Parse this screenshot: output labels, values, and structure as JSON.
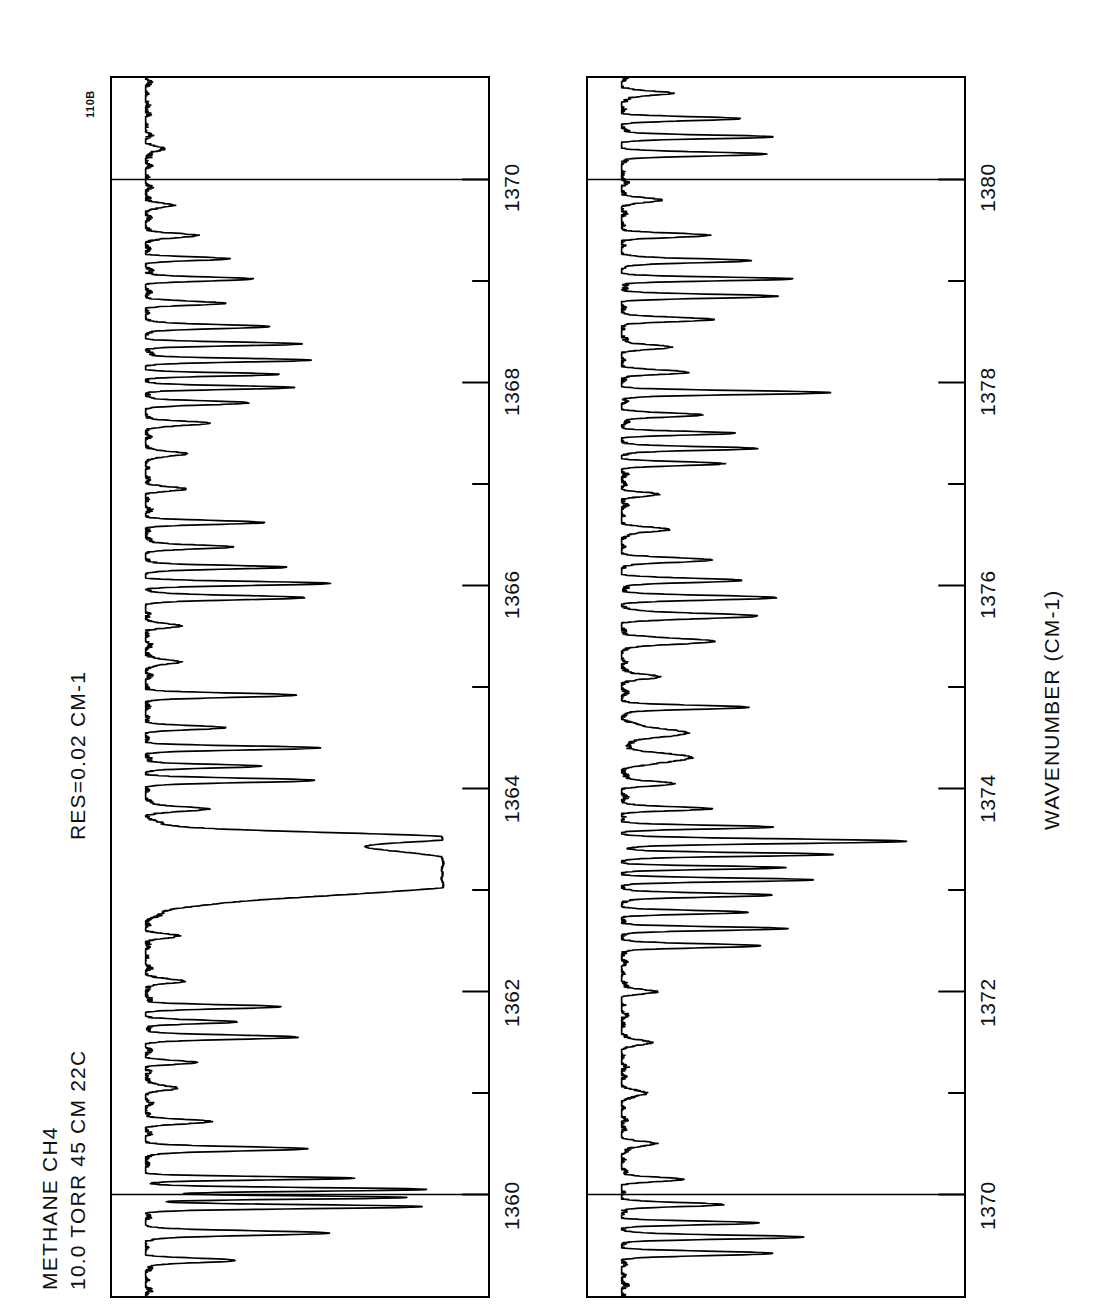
{
  "figure": {
    "corner_tag": "110B",
    "header_lines": [
      "METHANE   CH4",
      "10.0 TORR  45 CM 22C"
    ],
    "resolution_label": "RES=0.02  CM-1",
    "axis_title": "WAVENUMBER (CM-1)",
    "orientation": "rotated-90",
    "line_color": "#000000",
    "background_color": "#ffffff"
  },
  "chart_data": [
    {
      "type": "line",
      "id": "panel-upper",
      "title": "METHANE CH4 absorption spectrum 1359-1371 cm-1",
      "xlabel": "WAVENUMBER (CM-1)",
      "ylabel": "TRANSMITTANCE",
      "xlim": [
        1359.0,
        1371.0
      ],
      "ylim": [
        0.0,
        1.0
      ],
      "grid": false,
      "major_ticks": [
        1360,
        1362,
        1364,
        1366,
        1368,
        1370
      ],
      "minor_ticks": [
        1359,
        1361,
        1363,
        1365,
        1367,
        1369,
        1371
      ],
      "tick_labels": [
        "1360",
        "1362",
        "1364",
        "1366",
        "1368",
        "1370"
      ],
      "full_width_gridlines": [
        1360,
        1370
      ],
      "baseline": 0.97,
      "peaks": [
        {
          "x": 1359.35,
          "depth": 0.3,
          "width": 0.028
        },
        {
          "x": 1359.62,
          "depth": 0.62,
          "width": 0.03
        },
        {
          "x": 1359.88,
          "depth": 0.93,
          "width": 0.026
        },
        {
          "x": 1359.97,
          "depth": 0.88,
          "width": 0.022
        },
        {
          "x": 1360.05,
          "depth": 0.95,
          "width": 0.024
        },
        {
          "x": 1360.16,
          "depth": 0.7,
          "width": 0.022
        },
        {
          "x": 1360.45,
          "depth": 0.55,
          "width": 0.028
        },
        {
          "x": 1360.72,
          "depth": 0.22,
          "width": 0.03
        },
        {
          "x": 1361.05,
          "depth": 0.12,
          "width": 0.03
        },
        {
          "x": 1361.3,
          "depth": 0.17,
          "width": 0.026
        },
        {
          "x": 1361.55,
          "depth": 0.52,
          "width": 0.028
        },
        {
          "x": 1361.7,
          "depth": 0.3,
          "width": 0.024
        },
        {
          "x": 1361.85,
          "depth": 0.46,
          "width": 0.026
        },
        {
          "x": 1362.1,
          "depth": 0.14,
          "width": 0.03
        },
        {
          "x": 1362.55,
          "depth": 0.1,
          "width": 0.034
        },
        {
          "x": 1363.05,
          "depth": 0.88,
          "width": 0.15
        },
        {
          "x": 1363.3,
          "depth": 0.97,
          "width": 0.19
        },
        {
          "x": 1363.52,
          "depth": 0.74,
          "width": 0.06
        },
        {
          "x": 1363.8,
          "depth": 0.2,
          "width": 0.03
        },
        {
          "x": 1364.08,
          "depth": 0.56,
          "width": 0.028
        },
        {
          "x": 1364.22,
          "depth": 0.4,
          "width": 0.024
        },
        {
          "x": 1364.4,
          "depth": 0.58,
          "width": 0.026
        },
        {
          "x": 1364.6,
          "depth": 0.26,
          "width": 0.026
        },
        {
          "x": 1364.92,
          "depth": 0.5,
          "width": 0.028
        },
        {
          "x": 1365.25,
          "depth": 0.13,
          "width": 0.03
        },
        {
          "x": 1365.6,
          "depth": 0.11,
          "width": 0.03
        },
        {
          "x": 1365.88,
          "depth": 0.54,
          "width": 0.028
        },
        {
          "x": 1366.02,
          "depth": 0.62,
          "width": 0.026
        },
        {
          "x": 1366.18,
          "depth": 0.48,
          "width": 0.024
        },
        {
          "x": 1366.38,
          "depth": 0.3,
          "width": 0.026
        },
        {
          "x": 1366.62,
          "depth": 0.4,
          "width": 0.026
        },
        {
          "x": 1366.95,
          "depth": 0.12,
          "width": 0.03
        },
        {
          "x": 1367.3,
          "depth": 0.14,
          "width": 0.03
        },
        {
          "x": 1367.6,
          "depth": 0.22,
          "width": 0.028
        },
        {
          "x": 1367.8,
          "depth": 0.34,
          "width": 0.026
        },
        {
          "x": 1367.95,
          "depth": 0.5,
          "width": 0.024
        },
        {
          "x": 1368.08,
          "depth": 0.44,
          "width": 0.022
        },
        {
          "x": 1368.22,
          "depth": 0.56,
          "width": 0.024
        },
        {
          "x": 1368.38,
          "depth": 0.52,
          "width": 0.024
        },
        {
          "x": 1368.55,
          "depth": 0.42,
          "width": 0.026
        },
        {
          "x": 1368.78,
          "depth": 0.26,
          "width": 0.026
        },
        {
          "x": 1369.02,
          "depth": 0.36,
          "width": 0.026
        },
        {
          "x": 1369.22,
          "depth": 0.28,
          "width": 0.024
        },
        {
          "x": 1369.45,
          "depth": 0.18,
          "width": 0.028
        },
        {
          "x": 1369.75,
          "depth": 0.1,
          "width": 0.03
        },
        {
          "x": 1370.3,
          "depth": 0.07,
          "width": 0.034
        }
      ]
    },
    {
      "type": "line",
      "id": "panel-lower",
      "title": "METHANE CH4 absorption spectrum 1369-1381 cm-1",
      "xlabel": "WAVENUMBER (CM-1)",
      "ylabel": "TRANSMITTANCE",
      "xlim": [
        1369.0,
        1381.0
      ],
      "ylim": [
        0.0,
        1.0
      ],
      "grid": false,
      "major_ticks": [
        1370,
        1372,
        1374,
        1376,
        1378,
        1380
      ],
      "minor_ticks": [
        1369,
        1371,
        1373,
        1375,
        1377,
        1379,
        1381
      ],
      "tick_labels": [
        "1370",
        "1372",
        "1374",
        "1376",
        "1378",
        "1380"
      ],
      "full_width_gridlines": [
        1370,
        1380
      ],
      "baseline": 0.97,
      "peaks": [
        {
          "x": 1369.42,
          "depth": 0.5,
          "width": 0.028
        },
        {
          "x": 1369.58,
          "depth": 0.62,
          "width": 0.026
        },
        {
          "x": 1369.72,
          "depth": 0.46,
          "width": 0.024
        },
        {
          "x": 1369.9,
          "depth": 0.34,
          "width": 0.026
        },
        {
          "x": 1370.15,
          "depth": 0.2,
          "width": 0.028
        },
        {
          "x": 1370.5,
          "depth": 0.12,
          "width": 0.03
        },
        {
          "x": 1371.0,
          "depth": 0.09,
          "width": 0.032
        },
        {
          "x": 1371.5,
          "depth": 0.1,
          "width": 0.032
        },
        {
          "x": 1372.0,
          "depth": 0.11,
          "width": 0.03
        },
        {
          "x": 1372.45,
          "depth": 0.48,
          "width": 0.026
        },
        {
          "x": 1372.62,
          "depth": 0.56,
          "width": 0.024
        },
        {
          "x": 1372.78,
          "depth": 0.42,
          "width": 0.024
        },
        {
          "x": 1372.95,
          "depth": 0.52,
          "width": 0.026
        },
        {
          "x": 1373.1,
          "depth": 0.64,
          "width": 0.024
        },
        {
          "x": 1373.22,
          "depth": 0.55,
          "width": 0.022
        },
        {
          "x": 1373.35,
          "depth": 0.72,
          "width": 0.024
        },
        {
          "x": 1373.48,
          "depth": 0.96,
          "width": 0.03
        },
        {
          "x": 1373.62,
          "depth": 0.5,
          "width": 0.024
        },
        {
          "x": 1373.8,
          "depth": 0.3,
          "width": 0.026
        },
        {
          "x": 1374.05,
          "depth": 0.18,
          "width": 0.03
        },
        {
          "x": 1374.3,
          "depth": 0.24,
          "width": 0.06
        },
        {
          "x": 1374.55,
          "depth": 0.22,
          "width": 0.06
        },
        {
          "x": 1374.8,
          "depth": 0.44,
          "width": 0.026
        },
        {
          "x": 1375.1,
          "depth": 0.14,
          "width": 0.03
        },
        {
          "x": 1375.45,
          "depth": 0.3,
          "width": 0.04
        },
        {
          "x": 1375.7,
          "depth": 0.46,
          "width": 0.034
        },
        {
          "x": 1375.88,
          "depth": 0.52,
          "width": 0.03
        },
        {
          "x": 1376.05,
          "depth": 0.4,
          "width": 0.028
        },
        {
          "x": 1376.25,
          "depth": 0.3,
          "width": 0.03
        },
        {
          "x": 1376.55,
          "depth": 0.16,
          "width": 0.03
        },
        {
          "x": 1376.9,
          "depth": 0.12,
          "width": 0.03
        },
        {
          "x": 1377.2,
          "depth": 0.34,
          "width": 0.026
        },
        {
          "x": 1377.35,
          "depth": 0.46,
          "width": 0.024
        },
        {
          "x": 1377.5,
          "depth": 0.38,
          "width": 0.024
        },
        {
          "x": 1377.68,
          "depth": 0.28,
          "width": 0.026
        },
        {
          "x": 1377.9,
          "depth": 0.7,
          "width": 0.026
        },
        {
          "x": 1378.1,
          "depth": 0.22,
          "width": 0.028
        },
        {
          "x": 1378.35,
          "depth": 0.16,
          "width": 0.03
        },
        {
          "x": 1378.62,
          "depth": 0.3,
          "width": 0.028
        },
        {
          "x": 1378.85,
          "depth": 0.52,
          "width": 0.026
        },
        {
          "x": 1379.02,
          "depth": 0.58,
          "width": 0.024
        },
        {
          "x": 1379.2,
          "depth": 0.44,
          "width": 0.026
        },
        {
          "x": 1379.45,
          "depth": 0.28,
          "width": 0.028
        },
        {
          "x": 1379.8,
          "depth": 0.14,
          "width": 0.03
        },
        {
          "x": 1380.25,
          "depth": 0.48,
          "width": 0.026
        },
        {
          "x": 1380.42,
          "depth": 0.52,
          "width": 0.024
        },
        {
          "x": 1380.6,
          "depth": 0.4,
          "width": 0.026
        },
        {
          "x": 1380.85,
          "depth": 0.18,
          "width": 0.028
        }
      ]
    }
  ]
}
